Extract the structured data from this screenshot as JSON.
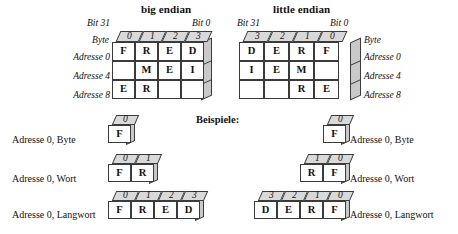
{
  "diagram": {
    "titles": {
      "big": "big endian",
      "little": "little endian"
    },
    "examples_heading": "Beispiele:",
    "axis": {
      "bit31": "Bit 31",
      "bit0": "Bit 0",
      "byte": "Byte"
    },
    "big_endian": {
      "byte_numbers": [
        "0",
        "1",
        "2",
        "3"
      ],
      "row_labels": [
        "Adresse 0",
        "Adresse 4",
        "Adresse 8"
      ],
      "rows": [
        [
          "F",
          "R",
          "E",
          "D"
        ],
        [
          "",
          "M",
          "E",
          "I"
        ],
        [
          "E",
          "R",
          "",
          ""
        ]
      ]
    },
    "little_endian": {
      "byte_numbers": [
        "3",
        "2",
        "1",
        "0"
      ],
      "row_labels": [
        "Adresse 0",
        "Adresse 4",
        "Adresse 8"
      ],
      "rows": [
        [
          "D",
          "E",
          "R",
          "F"
        ],
        [
          "I",
          "E",
          "M",
          ""
        ],
        [
          "",
          "",
          "R",
          "E"
        ]
      ]
    },
    "examples": {
      "big": [
        {
          "label": "Adresse 0, Byte",
          "byte_numbers": [
            "0"
          ],
          "values": [
            "F"
          ]
        },
        {
          "label": "Adresse 0, Wort",
          "byte_numbers": [
            "0",
            "1"
          ],
          "values": [
            "F",
            "R"
          ]
        },
        {
          "label": "Adresse 0, Langwort",
          "byte_numbers": [
            "0",
            "1",
            "2",
            "3"
          ],
          "values": [
            "F",
            "R",
            "E",
            "D"
          ]
        }
      ],
      "little": [
        {
          "label": "Adresse 0, Byte",
          "byte_numbers": [
            "0"
          ],
          "values": [
            "F"
          ]
        },
        {
          "label": "Adresse 0, Wort",
          "byte_numbers": [
            "1",
            "0"
          ],
          "values": [
            "R",
            "F"
          ]
        },
        {
          "label": "Adresse 0, Langwort",
          "byte_numbers": [
            "3",
            "2",
            "1",
            "0"
          ],
          "values": [
            "D",
            "E",
            "R",
            "F"
          ]
        }
      ]
    },
    "colors": {
      "header_fill": "#d9d9d9",
      "side_fill": "#c9c9c9",
      "stroke": "#3b3b3b",
      "cell_fill": "#ffffff"
    }
  }
}
